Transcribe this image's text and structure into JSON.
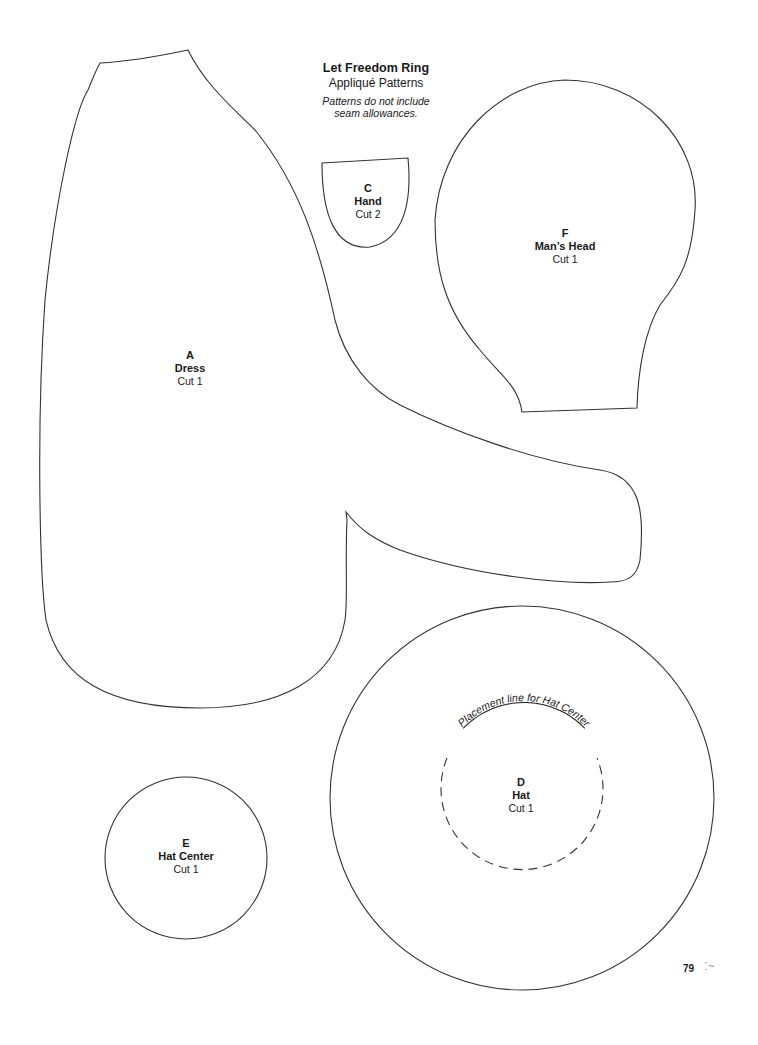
{
  "header": {
    "title": "Let Freedom Ring",
    "subtitle": "Appliqué Patterns",
    "note_line1": "Patterns do not include",
    "note_line2": "seam allowances."
  },
  "pieces": {
    "dress": {
      "letter": "A",
      "name": "Dress",
      "cut": "Cut 1"
    },
    "hand": {
      "letter": "C",
      "name": "Hand",
      "cut": "Cut 2"
    },
    "hat": {
      "letter": "D",
      "name": "Hat",
      "cut": "Cut 1",
      "placement_label": "Placement line for Hat Center"
    },
    "hat_center": {
      "letter": "E",
      "name": "Hat Center",
      "cut": "Cut 1"
    },
    "mans_head": {
      "letter": "F",
      "name": "Man’s Head",
      "cut": "Cut 1"
    }
  },
  "footer": {
    "page_number": "79",
    "glyph": "⁚~"
  }
}
